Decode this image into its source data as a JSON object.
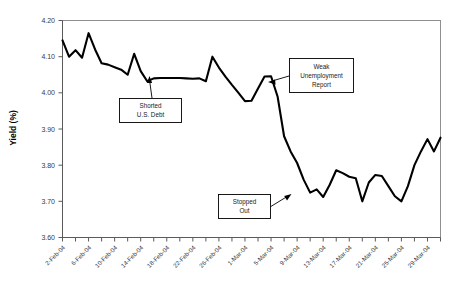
{
  "chart_data": {
    "type": "line",
    "title": "",
    "xlabel": "",
    "ylabel": "Yield (%)",
    "ylim": [
      3.6,
      4.2
    ],
    "ytick_labels": [
      "4.20",
      "4.10",
      "4.00",
      "3.90",
      "3.80",
      "3.70",
      "3.60"
    ],
    "ytick_values": [
      4.2,
      4.1,
      4.0,
      3.9,
      3.8,
      3.7,
      3.6
    ],
    "grid": false,
    "legend": "none",
    "xtick_labels": [
      "2-Feb-04",
      "6-Feb-04",
      "10-Feb-04",
      "14-Feb-04",
      "18-Feb-04",
      "22-Feb-04",
      "26-Feb-04",
      "1-Mar-04",
      "5-Mar-04",
      "9-Mar-04",
      "13-Mar-04",
      "17-Mar-04",
      "21-Mar-04",
      "25-Mar-04",
      "29-Mar-04"
    ],
    "series_name": "Yield",
    "line_color": "#000000",
    "x": [
      "2-Feb-04",
      "3-Feb-04",
      "4-Feb-04",
      "5-Feb-04",
      "6-Feb-04",
      "7-Feb-04",
      "8-Feb-04",
      "9-Feb-04",
      "10-Feb-04",
      "11-Feb-04",
      "12-Feb-04",
      "13-Feb-04",
      "14-Feb-04",
      "15-Feb-04",
      "16-Feb-04",
      "17-Feb-04",
      "18-Feb-04",
      "19-Feb-04",
      "20-Feb-04",
      "21-Feb-04",
      "22-Feb-04",
      "23-Feb-04",
      "24-Feb-04",
      "25-Feb-04",
      "26-Feb-04",
      "27-Feb-04",
      "28-Feb-04",
      "29-Feb-04",
      "1-Mar-04",
      "2-Mar-04",
      "3-Mar-04",
      "4-Mar-04",
      "5-Mar-04",
      "6-Mar-04",
      "7-Mar-04",
      "8-Mar-04",
      "9-Mar-04",
      "10-Mar-04",
      "11-Mar-04",
      "12-Mar-04",
      "13-Mar-04",
      "14-Mar-04",
      "15-Mar-04",
      "16-Mar-04",
      "17-Mar-04",
      "18-Mar-04",
      "19-Mar-04",
      "20-Mar-04",
      "21-Mar-04",
      "22-Mar-04",
      "23-Mar-04",
      "24-Mar-04",
      "25-Mar-04",
      "26-Mar-04",
      "27-Mar-04",
      "28-Mar-04",
      "29-Mar-04",
      "30-Mar-04",
      "31-Mar-04"
    ],
    "values": [
      4.145,
      4.1,
      4.118,
      4.097,
      4.165,
      4.12,
      4.082,
      4.078,
      4.071,
      4.064,
      4.05,
      4.108,
      4.06,
      4.032,
      4.04,
      4.041,
      4.041,
      4.041,
      4.041,
      4.04,
      4.039,
      4.04,
      4.032,
      4.1,
      4.07,
      4.045,
      4.022,
      4.0,
      3.977,
      3.978,
      4.012,
      4.045,
      4.046,
      3.99,
      3.88,
      3.838,
      3.806,
      3.76,
      3.724,
      3.733,
      3.712,
      3.746,
      3.786,
      3.778,
      3.768,
      3.764,
      3.7,
      3.752,
      3.773,
      3.77,
      3.742,
      3.714,
      3.7,
      3.742,
      3.8,
      3.838,
      3.872,
      3.838,
      3.876
    ]
  },
  "annotations": [
    {
      "id": "shorted-us-debt",
      "line1": "Shorted",
      "line2": "U.S. Debt",
      "line3": ""
    },
    {
      "id": "weak-unemployment-report",
      "line1": "Weak",
      "line2": "Unemployment",
      "line3": "Report"
    },
    {
      "id": "stopped-out",
      "line1": "Stopped",
      "line2": "Out",
      "line3": ""
    }
  ]
}
